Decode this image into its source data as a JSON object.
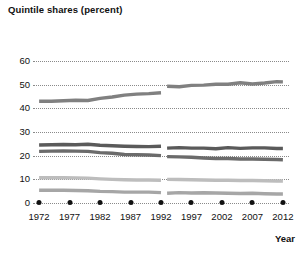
{
  "chart_data": {
    "type": "line",
    "title": "Quintile shares (percent)",
    "xlabel": "Year",
    "ylabel": "",
    "xlim": [
      1971,
      2013
    ],
    "ylim": [
      0,
      60
    ],
    "yticks": [
      0,
      10,
      20,
      30,
      40,
      50,
      60
    ],
    "xticks": [
      1972,
      1977,
      1982,
      1987,
      1992,
      1997,
      2002,
      2007,
      2012
    ],
    "grid": "horizontal-dotted",
    "legend": "none",
    "break_after_year": 1992,
    "series": [
      {
        "name": "Highest quintile",
        "color": "#808080",
        "x": [
          1972,
          1974,
          1976,
          1978,
          1980,
          1982,
          1984,
          1986,
          1988,
          1990,
          1992,
          1993,
          1995,
          1997,
          1999,
          2001,
          2003,
          2005,
          2007,
          2009,
          2011,
          2012
        ],
        "values": [
          43.0,
          43.0,
          43.2,
          43.4,
          43.3,
          44.2,
          44.8,
          45.6,
          46.0,
          46.2,
          46.6,
          49.3,
          49.1,
          49.7,
          49.8,
          50.2,
          50.2,
          50.8,
          50.3,
          50.7,
          51.3,
          51.2
        ]
      },
      {
        "name": "Fourth quintile",
        "color": "#5a5a5a",
        "x": [
          1972,
          1974,
          1976,
          1978,
          1980,
          1982,
          1984,
          1986,
          1988,
          1990,
          1992,
          1993,
          1995,
          1997,
          1999,
          2001,
          2003,
          2005,
          2007,
          2009,
          2011,
          2012
        ],
        "values": [
          24.5,
          24.6,
          24.7,
          24.6,
          24.8,
          24.4,
          24.2,
          24.0,
          23.9,
          23.8,
          24.0,
          23.2,
          23.4,
          23.2,
          23.2,
          22.9,
          23.4,
          23.1,
          23.3,
          23.3,
          23.0,
          23.0
        ]
      },
      {
        "name": "Third quintile",
        "color": "#6b6b6b",
        "x": [
          1972,
          1974,
          1976,
          1978,
          1980,
          1982,
          1984,
          1986,
          1988,
          1990,
          1992,
          1993,
          1995,
          1997,
          1999,
          2001,
          2003,
          2005,
          2007,
          2009,
          2011,
          2012
        ],
        "values": [
          21.8,
          21.9,
          22.0,
          21.9,
          21.8,
          21.3,
          21.0,
          20.5,
          20.4,
          20.3,
          20.0,
          19.6,
          19.5,
          19.3,
          19.0,
          18.8,
          18.8,
          18.6,
          18.6,
          18.5,
          18.4,
          18.3
        ]
      },
      {
        "name": "Second quintile",
        "color": "#bdbdbd",
        "x": [
          1972,
          1974,
          1976,
          1978,
          1980,
          1982,
          1984,
          1986,
          1988,
          1990,
          1992,
          1993,
          1995,
          1997,
          1999,
          2001,
          2003,
          2005,
          2007,
          2009,
          2011,
          2012
        ],
        "values": [
          10.7,
          10.7,
          10.7,
          10.6,
          10.5,
          10.2,
          10.0,
          9.8,
          9.7,
          9.7,
          9.6,
          10.0,
          9.9,
          9.8,
          9.7,
          9.6,
          9.6,
          9.5,
          9.5,
          9.4,
          9.3,
          9.3
        ]
      },
      {
        "name": "Lowest quintile",
        "color": "#a6a6a6",
        "x": [
          1972,
          1974,
          1976,
          1978,
          1980,
          1982,
          1984,
          1986,
          1988,
          1990,
          1992,
          1993,
          1995,
          1997,
          1999,
          2001,
          2003,
          2005,
          2007,
          2009,
          2011,
          2012
        ],
        "values": [
          5.4,
          5.4,
          5.4,
          5.3,
          5.2,
          4.9,
          4.8,
          4.6,
          4.6,
          4.6,
          4.4,
          4.1,
          4.4,
          4.2,
          4.3,
          4.2,
          4.1,
          4.0,
          4.1,
          3.9,
          3.8,
          3.8
        ]
      }
    ]
  }
}
